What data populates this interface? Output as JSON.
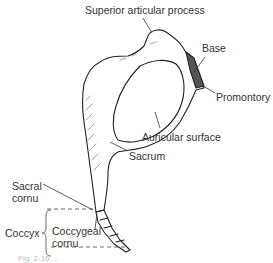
{
  "diagram": {
    "labels": {
      "superior_articular_process": "Superior articular process",
      "base": "Base",
      "promontory": "Promontory",
      "auricular_surface": "Auricular surface",
      "sacrum": "Sacrum",
      "sacral_cornu_line1": "Sacral",
      "sacral_cornu_line2": "cornu",
      "coccyx": "Coccyx",
      "coccygeal_cornu_line1": "Coccygeal",
      "coccygeal_cornu_line2": "cornu"
    },
    "caption": "Fig. 2-16 ..."
  }
}
